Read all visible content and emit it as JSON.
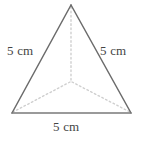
{
  "figure": {
    "name": "triangular-pyramid",
    "background_color": "#ffffff",
    "outline_color": "#6b6b6b",
    "hidden_edge_color": "#cfcfcf",
    "label_color": "#444444",
    "labels": {
      "left_edge": "5 cm",
      "right_edge": "5 cm",
      "base_edge": "5 cm"
    },
    "vertices": {
      "apex": {
        "x": 71,
        "y": 5
      },
      "base_left": {
        "x": 12,
        "y": 113
      },
      "base_right": {
        "x": 131,
        "y": 113
      },
      "back_center": {
        "x": 71,
        "y": 82
      }
    },
    "solid_edges": [
      {
        "name": "left-edge",
        "from": "apex",
        "to": "base_left"
      },
      {
        "name": "right-edge",
        "from": "apex",
        "to": "base_right"
      },
      {
        "name": "base-edge",
        "from": "base_left",
        "to": "base_right"
      }
    ],
    "hidden_edges": [
      {
        "name": "apex-to-back-vertex",
        "from": "apex",
        "to": "back_center"
      },
      {
        "name": "back-vertex-to-base-left",
        "from": "back_center",
        "to": "base_left"
      },
      {
        "name": "back-vertex-to-base-right",
        "from": "back_center",
        "to": "base_right"
      }
    ]
  }
}
